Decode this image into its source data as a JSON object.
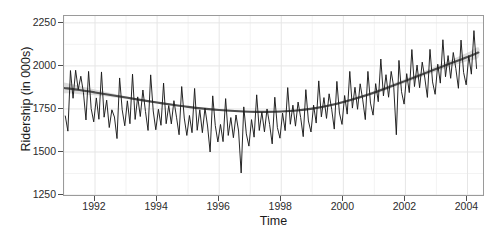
{
  "chart_data": {
    "type": "line",
    "title": "",
    "xlabel": "Time",
    "ylabel": "Ridership (in 000s)",
    "xlim": [
      1991.0,
      2004.5
    ],
    "ylim": [
      1250,
      2290
    ],
    "grid": true,
    "legend": "none",
    "y_ticks": [
      1250,
      1500,
      1750,
      2000,
      2250
    ],
    "x_ticks": [
      1992,
      1994,
      1996,
      1998,
      2000,
      2002,
      2004
    ],
    "y_minor_ticks": [
      1375,
      1625,
      1875,
      2125
    ],
    "x_minor_ticks": [
      1991,
      1993,
      1995,
      1997,
      1999,
      2001,
      2003
    ],
    "series": [
      {
        "name": "Ridership",
        "style": "line",
        "color": "#1a1a1a",
        "x": [
          1991.042,
          1991.125,
          1991.208,
          1991.292,
          1991.375,
          1991.458,
          1991.542,
          1991.625,
          1991.708,
          1991.792,
          1991.875,
          1991.958,
          1992.042,
          1992.125,
          1992.208,
          1992.292,
          1992.375,
          1992.458,
          1992.542,
          1992.625,
          1992.708,
          1992.792,
          1992.875,
          1992.958,
          1993.042,
          1993.125,
          1993.208,
          1993.292,
          1993.375,
          1993.458,
          1993.542,
          1993.625,
          1993.708,
          1993.792,
          1993.875,
          1993.958,
          1994.042,
          1994.125,
          1994.208,
          1994.292,
          1994.375,
          1994.458,
          1994.542,
          1994.625,
          1994.708,
          1994.792,
          1994.875,
          1994.958,
          1995.042,
          1995.125,
          1995.208,
          1995.292,
          1995.375,
          1995.458,
          1995.542,
          1995.625,
          1995.708,
          1995.792,
          1995.875,
          1995.958,
          1996.042,
          1996.125,
          1996.208,
          1996.292,
          1996.375,
          1996.458,
          1996.542,
          1996.625,
          1996.708,
          1996.792,
          1996.875,
          1996.958,
          1997.042,
          1997.125,
          1997.208,
          1997.292,
          1997.375,
          1997.458,
          1997.542,
          1997.625,
          1997.708,
          1997.792,
          1997.875,
          1997.958,
          1998.042,
          1998.125,
          1998.208,
          1998.292,
          1998.375,
          1998.458,
          1998.542,
          1998.625,
          1998.708,
          1998.792,
          1998.875,
          1998.958,
          1999.042,
          1999.125,
          1999.208,
          1999.292,
          1999.375,
          1999.458,
          1999.542,
          1999.625,
          1999.708,
          1999.792,
          1999.875,
          1999.958,
          2000.042,
          2000.125,
          2000.208,
          2000.292,
          2000.375,
          2000.458,
          2000.542,
          2000.625,
          2000.708,
          2000.792,
          2000.875,
          2000.958,
          2001.042,
          2001.125,
          2001.208,
          2001.292,
          2001.375,
          2001.458,
          2001.542,
          2001.625,
          2001.708,
          2001.792,
          2001.875,
          2001.958,
          2002.042,
          2002.125,
          2002.208,
          2002.292,
          2002.375,
          2002.458,
          2002.542,
          2002.625,
          2002.708,
          2002.792,
          2002.875,
          2002.958,
          2003.042,
          2003.125,
          2003.208,
          2003.292,
          2003.375,
          2003.458,
          2003.542,
          2003.625,
          2003.708,
          2003.792,
          2003.875,
          2003.958,
          2004.042,
          2004.125,
          2004.208,
          2004.292
        ],
        "values": [
          1709,
          1621,
          1973,
          1812,
          1975,
          1862,
          1940,
          1847,
          1686,
          1968,
          1752,
          1675,
          1814,
          1690,
          1965,
          1702,
          1801,
          1642,
          1745,
          1703,
          1578,
          1930,
          1745,
          1652,
          1797,
          1664,
          1952,
          1689,
          1820,
          1706,
          1860,
          1735,
          1625,
          1948,
          1738,
          1629,
          1748,
          1655,
          1900,
          1664,
          1770,
          1663,
          1798,
          1702,
          1600,
          1880,
          1697,
          1596,
          1712,
          1612,
          1869,
          1626,
          1745,
          1612,
          1755,
          1651,
          1500,
          1826,
          1653,
          1558,
          1660,
          1560,
          1810,
          1596,
          1700,
          1583,
          1715,
          1622,
          1378,
          1762,
          1605,
          1534,
          1688,
          1586,
          1832,
          1625,
          1732,
          1617,
          1750,
          1660,
          1547,
          1818,
          1642,
          1580,
          1726,
          1624,
          1874,
          1661,
          1772,
          1650,
          1790,
          1700,
          1589,
          1862,
          1680,
          1616,
          1772,
          1668,
          1913,
          1704,
          1816,
          1695,
          1838,
          1748,
          1633,
          1910,
          1726,
          1660,
          1828,
          1720,
          1968,
          1755,
          1876,
          1748,
          1896,
          1803,
          1688,
          1968,
          1784,
          1714,
          1897,
          1792,
          2040,
          1826,
          1949,
          1818,
          1968,
          1875,
          1600,
          2032,
          1850,
          1778,
          1955,
          1845,
          2095,
          1880,
          2005,
          1873,
          2022,
          1930,
          1817,
          2096,
          1907,
          1835,
          2010,
          1900,
          2152,
          1937,
          2060,
          1928,
          2078,
          1985,
          1870,
          2150,
          1962,
          1890,
          2060,
          1952,
          2205,
          1985
        ]
      },
      {
        "name": "LOESS smooth",
        "style": "smooth",
        "color": "#4d4d4d",
        "ribbon_color": "#bfbfbf",
        "x": [
          1991.0,
          1991.5,
          1992.0,
          1992.5,
          1993.0,
          1993.5,
          1994.0,
          1994.5,
          1995.0,
          1995.5,
          1996.0,
          1996.5,
          1997.0,
          1997.5,
          1998.0,
          1998.5,
          1999.0,
          1999.5,
          2000.0,
          2000.5,
          2001.0,
          2001.5,
          2002.0,
          2002.5,
          2003.0,
          2003.5,
          2004.0,
          2004.35
        ],
        "values": [
          1872,
          1860,
          1846,
          1831,
          1816,
          1801,
          1787,
          1774,
          1762,
          1752,
          1744,
          1738,
          1734,
          1733,
          1735,
          1741,
          1752,
          1768,
          1790,
          1816,
          1846,
          1879,
          1913,
          1948,
          1983,
          2018,
          2052,
          2078
        ],
        "lower": [
          1841,
          1836,
          1829,
          1819,
          1808,
          1795,
          1782,
          1770,
          1758,
          1748,
          1740,
          1734,
          1730,
          1729,
          1731,
          1736,
          1747,
          1762,
          1783,
          1808,
          1836,
          1868,
          1901,
          1934,
          1967,
          1999,
          2028,
          2048
        ],
        "upper": [
          1903,
          1884,
          1863,
          1843,
          1824,
          1807,
          1792,
          1778,
          1766,
          1756,
          1748,
          1742,
          1738,
          1737,
          1739,
          1746,
          1757,
          1774,
          1797,
          1824,
          1856,
          1890,
          1925,
          1962,
          1999,
          2037,
          2076,
          2108
        ]
      }
    ]
  },
  "axis": {
    "y_title": "Ridership (in 000s)",
    "x_title": "Time",
    "y_labels": [
      "2250",
      "2000",
      "1750",
      "1500",
      "1250"
    ],
    "x_labels": [
      "1992",
      "1994",
      "1996",
      "1998",
      "2000",
      "2002",
      "2004"
    ]
  },
  "colors": {
    "panel_background": "#ffffff",
    "panel_border": "#9a9a9a",
    "grid_major": "#e6e6e6",
    "grid_minor": "#f2f2f2",
    "series_line": "#1a1a1a",
    "smooth_line": "#4d4d4d",
    "confidence_band": "#bfbfbf",
    "text": "#1a1a1a"
  }
}
